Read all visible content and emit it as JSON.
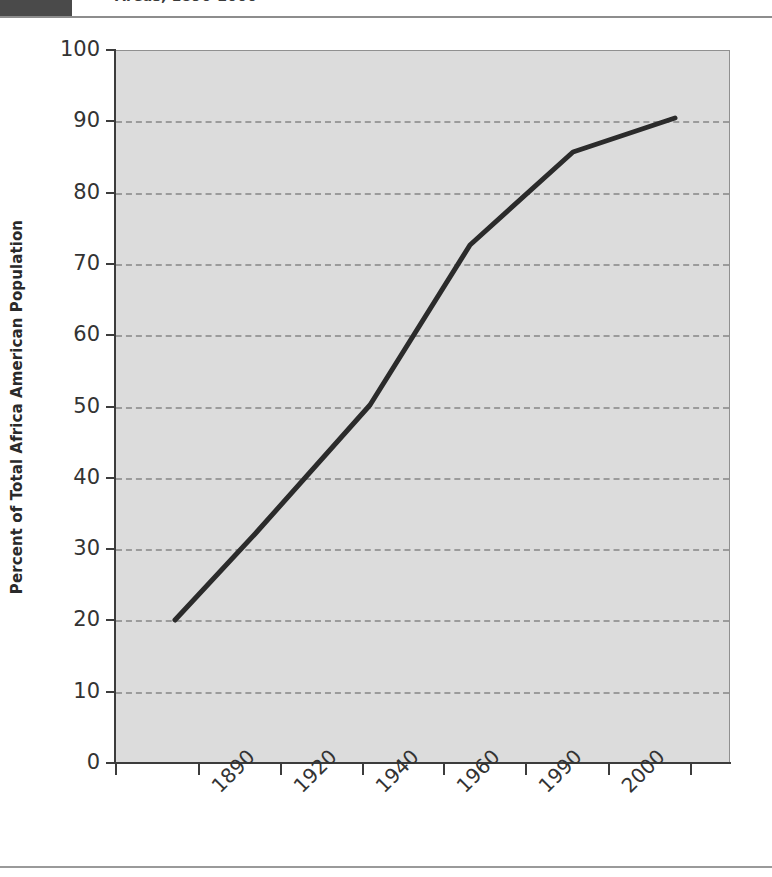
{
  "header": {
    "title": "Areas, 1890-2000",
    "block_color": "#4a4a4a"
  },
  "chart_data": {
    "type": "line",
    "title": "Areas, 1890-2000",
    "xlabel": "",
    "ylabel": "Percent of Total Africa American Population",
    "xlim": [
      1870,
      2000
    ],
    "ylim": [
      0,
      100
    ],
    "grid": true,
    "legend": "none",
    "line_color": "#2b2b2b",
    "plot_background": "#dcdcdc",
    "gridline_color": "#9b9b9b",
    "axis_color": "#3c3c3c",
    "y_ticks": [
      0,
      10,
      20,
      30,
      40,
      50,
      60,
      70,
      80,
      90,
      100
    ],
    "y_tick_labels": [
      "0",
      "10",
      "20",
      "30",
      "40",
      "50",
      "60",
      "70",
      "80",
      "90",
      "100"
    ],
    "x_ticks": [
      1880,
      1890,
      1910,
      1920,
      1930,
      1940,
      1960,
      1980,
      1990,
      2000
    ],
    "x_tick_labels": [
      "1890",
      "1920",
      "1940",
      "1960",
      "1990",
      "2000"
    ],
    "x_tick_label_positions": [
      198,
      280,
      362,
      443,
      525,
      608
    ],
    "x_tick_mark_positions": [
      115,
      198,
      280,
      362,
      443,
      525,
      608,
      690
    ],
    "series": [
      {
        "name": "Percent of Total Africa American Population",
        "x": [
          1880,
          1900,
          1930,
          1950,
          1975,
          1995
        ],
        "values": [
          20,
          32,
          50,
          73,
          86,
          90.5
        ]
      }
    ],
    "points_px": [
      [
        175,
        620
      ],
      [
        255,
        534
      ],
      [
        370,
        405
      ],
      [
        470,
        245
      ],
      [
        573,
        152
      ],
      [
        675,
        118
      ]
    ]
  }
}
